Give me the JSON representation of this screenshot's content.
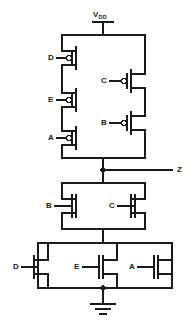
{
  "diagram": {
    "stroke_color": "#1a1a1a",
    "background_color": "#ffffff",
    "supply": {
      "name": "vdd-rail",
      "label_main": "V",
      "label_sub": "DD"
    },
    "output": {
      "name": "output-node",
      "label": "Z"
    },
    "ground": {
      "name": "ground-symbol",
      "label": ""
    },
    "pmos_left_series": [
      {
        "label": "D",
        "name": "pmos-d"
      },
      {
        "label": "E",
        "name": "pmos-e"
      },
      {
        "label": "A",
        "name": "pmos-a"
      }
    ],
    "pmos_right_series": [
      {
        "label": "C",
        "name": "pmos-c"
      },
      {
        "label": "B",
        "name": "pmos-b"
      }
    ],
    "nmos_upper_parallel": [
      {
        "label": "B",
        "name": "nmos-b"
      },
      {
        "label": "C",
        "name": "nmos-c"
      }
    ],
    "nmos_lower_parallel": [
      {
        "label": "D",
        "name": "nmos-d"
      },
      {
        "label": "E",
        "name": "nmos-e"
      },
      {
        "label": "A",
        "name": "nmos-a"
      }
    ]
  }
}
